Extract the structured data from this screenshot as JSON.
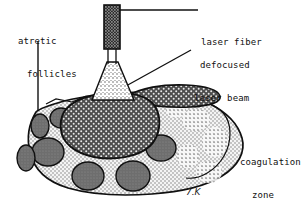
{
  "figure": {
    "signature": "7.K",
    "background_color": "#ffffff",
    "ink_color": "#101010"
  },
  "labels": {
    "atretic_follicles": {
      "line1": "atretic",
      "line2": "follicles"
    },
    "laser_fiber": {
      "line1": "laser fiber"
    },
    "defocused_laser_beam": {
      "line1": "defocused",
      "line2": "laser beam"
    },
    "coagulation_zone": {
      "line1": "coagulation",
      "line2": "zone",
      "line3": "(wedge)"
    }
  },
  "parts": {
    "laser_fiber_icon": "laser-fiber",
    "beam_cone_icon": "defocused-beam-cone",
    "ovary_icon": "ovary-body",
    "wedge_icon": "coagulation-wedge",
    "follicle_icon": "atretic-follicle"
  },
  "colors": {
    "outline": "#101010",
    "ovary_fill": "#f2f2f2",
    "follicle_fill": "#6e6e6e",
    "wedge_fill": "#4a4a4a",
    "fiber_fill": "#2b2b2b",
    "cone_fill": "#d8d8d8"
  }
}
